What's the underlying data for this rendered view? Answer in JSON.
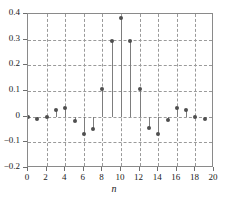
{
  "chart_data": {
    "type": "scatter",
    "plot_style": "stem",
    "title": "",
    "subtitle": "",
    "xlabel": "n",
    "ylabel": "",
    "x": [
      0,
      1,
      2,
      3,
      4,
      5,
      6,
      7,
      8,
      9,
      10,
      11,
      12,
      13,
      14,
      15,
      16,
      17,
      18,
      19,
      20
    ],
    "values": [
      0.0,
      -0.01,
      0.0,
      0.025,
      0.032,
      -0.015,
      -0.068,
      -0.047,
      0.106,
      0.295,
      0.383,
      0.295,
      0.106,
      -0.045,
      -0.068,
      -0.013,
      0.033,
      0.026,
      -0.002,
      -0.009,
      0.0
    ],
    "categories": [
      "0",
      "1",
      "2",
      "3",
      "4",
      "5",
      "6",
      "7",
      "8",
      "9",
      "10",
      "11",
      "12",
      "13",
      "14",
      "15",
      "16",
      "17",
      "18",
      "19",
      "20"
    ],
    "xlim": [
      0,
      20
    ],
    "ylim": [
      -0.2,
      0.4
    ],
    "xticks": [
      0,
      2,
      4,
      6,
      8,
      10,
      12,
      14,
      16,
      18,
      20
    ],
    "xticklabels": [
      "0",
      "2",
      "4",
      "6",
      "8",
      "10",
      "12",
      "14",
      "16",
      "18",
      "20"
    ],
    "yticks": [
      0.4,
      0.3,
      0.2,
      0.1,
      0.0,
      -0.1,
      -0.2
    ],
    "yticklabels": [
      "0.4",
      "0.3",
      "0.2",
      "0.1",
      "0",
      "−0.1",
      "−0.2"
    ],
    "grid": true,
    "grid_style": "dashed",
    "legend": null,
    "legend_position": "none",
    "annotations": [],
    "marker_color": "#4f4f4f",
    "stem_color": "#7d7d7d",
    "grid_color": "#9a9a9a",
    "axis_color": "#8a8a8a",
    "baseline": 0.0
  }
}
